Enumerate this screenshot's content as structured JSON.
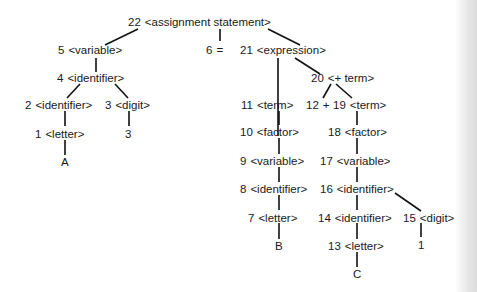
{
  "diagram": {
    "type": "parse-tree",
    "nodes": {
      "n22": {
        "num": "22",
        "label": "<assignment statement>"
      },
      "n5": {
        "num": "5",
        "label": "<variable>"
      },
      "n6": {
        "num": "6",
        "label": "="
      },
      "n21": {
        "num": "21",
        "label": "<expression>"
      },
      "n4": {
        "num": "4",
        "label": "<identifier>"
      },
      "n20": {
        "num": "20",
        "label": "<+ term>"
      },
      "n2": {
        "num": "2",
        "label": "<identifier>"
      },
      "n3": {
        "num": "3",
        "label": "<digit>"
      },
      "n11": {
        "num": "11",
        "label": "<term>"
      },
      "n12": {
        "num": "12",
        "label": "+"
      },
      "n19": {
        "num": "19",
        "label": "<term>"
      },
      "n1": {
        "num": "1",
        "label": "<letter>"
      },
      "n10": {
        "num": "10",
        "label": "<factor>"
      },
      "n18": {
        "num": "18",
        "label": "<factor>"
      },
      "n9": {
        "num": "9",
        "label": "<variable>"
      },
      "n17": {
        "num": "17",
        "label": "<variable>"
      },
      "n8": {
        "num": "8",
        "label": "<identifier>"
      },
      "n16": {
        "num": "16",
        "label": "<identifier>"
      },
      "n7": {
        "num": "7",
        "label": "<letter>"
      },
      "n14": {
        "num": "14",
        "label": "<identifier>"
      },
      "n15": {
        "num": "15",
        "label": "<digit>"
      },
      "n13": {
        "num": "13",
        "label": "<letter>"
      }
    },
    "leaves": {
      "A": "A",
      "d3": "3",
      "B": "B",
      "C": "C",
      "d1": "1"
    }
  }
}
